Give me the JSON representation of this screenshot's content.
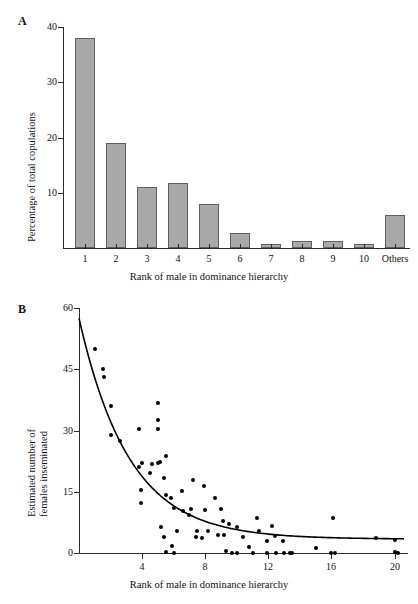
{
  "figure": {
    "panels": [
      {
        "letter": "A",
        "chart_data": {
          "type": "bar",
          "title": "",
          "xlabel": "Rank of male in dominance hierarchy",
          "ylabel": "Percentage of total copulations",
          "categories": [
            "1",
            "2",
            "3",
            "4",
            "5",
            "6",
            "7",
            "8",
            "9",
            "10",
            "Others"
          ],
          "values": [
            38,
            19,
            11,
            11.8,
            8,
            2.7,
            0.7,
            1.2,
            1.2,
            0.8,
            6
          ],
          "ylim": [
            0,
            40
          ],
          "yticks": [
            0,
            10,
            20,
            30,
            40
          ],
          "ytick_labels": [
            "",
            "10",
            "20",
            "30",
            "40"
          ],
          "grid": false,
          "legend": "none",
          "bar_fill": "#a9a9a9",
          "bar_edge": "#5f5f5f"
        }
      },
      {
        "letter": "B",
        "chart_data": {
          "type": "scatter",
          "title": "",
          "xlabel": "Rank of male in dominance hierarchy",
          "ylabel": "Estimated number of females inseminated",
          "ylabel_line1": "Estimated number of",
          "ylabel_line2": "females inseminated",
          "xlim": [
            0,
            20.6
          ],
          "ylim": [
            0,
            60
          ],
          "xticks": [
            4,
            8,
            12,
            16,
            20
          ],
          "yticks": [
            0,
            15,
            30,
            45,
            60
          ],
          "grid": false,
          "legend": "none",
          "marker_color": "#000000",
          "points": [
            [
              1.0,
              50.0
            ],
            [
              1.5,
              45.0
            ],
            [
              1.6,
              43.0
            ],
            [
              2.0,
              36.0
            ],
            [
              2.0,
              29.0
            ],
            [
              2.6,
              27.5
            ],
            [
              3.8,
              30.5
            ],
            [
              3.8,
              21.0
            ],
            [
              4.0,
              22.0
            ],
            [
              3.9,
              15.5
            ],
            [
              3.9,
              12.3
            ],
            [
              4.6,
              21.8
            ],
            [
              4.5,
              19.5
            ],
            [
              5.0,
              36.8
            ],
            [
              5.0,
              32.5
            ],
            [
              5.0,
              30.5
            ],
            [
              5.0,
              22.0
            ],
            [
              5.1,
              22.2
            ],
            [
              5.5,
              23.8
            ],
            [
              5.4,
              18.5
            ],
            [
              5.5,
              14.3
            ],
            [
              5.2,
              6.5
            ],
            [
              5.4,
              4.0
            ],
            [
              5.5,
              0.3
            ],
            [
              5.8,
              13.5
            ],
            [
              5.9,
              1.7
            ],
            [
              6.0,
              11.0
            ],
            [
              6.2,
              5.5
            ],
            [
              6.0,
              0.0
            ],
            [
              6.5,
              15.2
            ],
            [
              6.6,
              10.4
            ],
            [
              7.0,
              9.2
            ],
            [
              7.1,
              10.7
            ],
            [
              7.2,
              17.8
            ],
            [
              7.4,
              4.0
            ],
            [
              7.5,
              5.5
            ],
            [
              7.8,
              3.8
            ],
            [
              7.9,
              16.3
            ],
            [
              8.0,
              10.6
            ],
            [
              8.2,
              5.5
            ],
            [
              8.6,
              13.6
            ],
            [
              8.8,
              4.5
            ],
            [
              9.0,
              10.7
            ],
            [
              9.1,
              7.8
            ],
            [
              9.2,
              4.5
            ],
            [
              9.3,
              0.4
            ],
            [
              9.5,
              7.0
            ],
            [
              9.7,
              0.0
            ],
            [
              10.0,
              6.4
            ],
            [
              10.0,
              0.0
            ],
            [
              10.4,
              3.9
            ],
            [
              10.8,
              1.6
            ],
            [
              11.0,
              0.0
            ],
            [
              11.3,
              8.6
            ],
            [
              11.4,
              5.5
            ],
            [
              11.9,
              3.0
            ],
            [
              11.9,
              0.0
            ],
            [
              12.2,
              6.7
            ],
            [
              12.4,
              4.2
            ],
            [
              12.5,
              0.0
            ],
            [
              12.9,
              3.0
            ],
            [
              13.0,
              0.0
            ],
            [
              13.4,
              0.0
            ],
            [
              13.5,
              0.0
            ],
            [
              15.0,
              1.3
            ],
            [
              16.1,
              8.5
            ],
            [
              16.0,
              0.0
            ],
            [
              16.2,
              0.0
            ],
            [
              18.8,
              3.6
            ],
            [
              20.0,
              3.2
            ],
            [
              20.0,
              0.2
            ],
            [
              20.2,
              0.0
            ]
          ],
          "fit_curve": {
            "description": "exponential decay fit",
            "y_at_x0": 57.5,
            "asymptote": 3.4,
            "decay_rate": 0.315
          }
        }
      }
    ]
  }
}
